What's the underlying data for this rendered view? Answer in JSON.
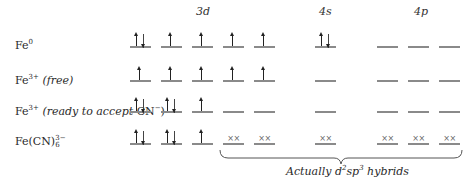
{
  "headers": {
    "d3": "3d",
    "s4": "4s",
    "p4": "4p"
  },
  "rows": [
    {
      "label": {
        "base": "Fe",
        "sup": "0",
        "note": ""
      },
      "d3": [
        "ud",
        "u",
        "u",
        "u",
        "u"
      ],
      "s4": [
        "ud"
      ],
      "p4": [
        "",
        "",
        ""
      ]
    },
    {
      "label": {
        "base": "Fe",
        "sup": "3+",
        "note": "(free)"
      },
      "d3": [
        "u",
        "u",
        "u",
        "u",
        "u"
      ],
      "s4": [
        ""
      ],
      "p4": [
        "",
        "",
        ""
      ]
    },
    {
      "label": {
        "base": "Fe",
        "sup": "3+",
        "note": "(ready to accept",
        "note_tail": "CN",
        "note_tail_sup": "−",
        "close": ")"
      },
      "d3": [
        "ud",
        "ud",
        "u",
        "",
        ""
      ],
      "s4": [
        ""
      ],
      "p4": [
        "",
        "",
        ""
      ]
    },
    {
      "label": {
        "base": "Fe(CN)",
        "sup": "3−",
        "sub": "6"
      },
      "d3": [
        "ud",
        "ud",
        "u",
        "xx",
        "xx"
      ],
      "s4": [
        "xx"
      ],
      "p4": [
        "xx",
        "xx",
        "xx"
      ]
    }
  ],
  "xx_mark": "××",
  "annotation": {
    "prefix": "Actually d",
    "sup1": "2",
    "mid": "sp",
    "sup2": "3",
    "suffix": " hybrids"
  },
  "colors": {
    "orbital_line": "#8a8a8a",
    "arrow": "#222222",
    "text": "#2a2a2a"
  }
}
